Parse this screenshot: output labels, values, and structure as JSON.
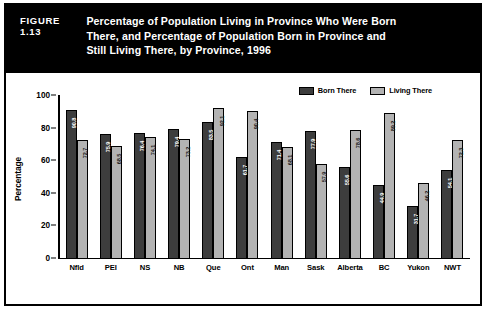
{
  "figure": {
    "number": "FIGURE 1.13",
    "title_lines": [
      "Percentage of Population Living in Province Who Were Born",
      "There, and Percentage of Population Born in Province and",
      "Still Living There, by Province, 1996"
    ]
  },
  "colors": {
    "banner_background": "#000000",
    "banner_text": "#ffffff",
    "born_there": "#3d3d3d",
    "living_there": "#b3b3b3",
    "page_background": "#ffffff",
    "frame_border": "#000000"
  },
  "chart_data": {
    "type": "bar",
    "title": "Percentage of Population Living in Province Who Were Born There, and Percentage of Population Born in Province and Still Living There, by Province, 1996",
    "xlabel": "",
    "ylabel": "Percentage",
    "ylim": [
      0,
      100
    ],
    "yticks": [
      0,
      20,
      40,
      60,
      80,
      100
    ],
    "grid": false,
    "legend_position": "top-right",
    "categories": [
      "Nfld",
      "PEI",
      "NS",
      "NB",
      "Que",
      "Ont",
      "Man",
      "Sask",
      "Alberta",
      "BC",
      "Yukon",
      "NWT"
    ],
    "series": [
      {
        "name": "Born There",
        "color": "#3d3d3d",
        "values": [
          90.8,
          75.9,
          76.4,
          79.4,
          83.5,
          61.7,
          71.4,
          77.9,
          55.6,
          44.9,
          31.7,
          54.1
        ]
      },
      {
        "name": "Living There",
        "color": "#b3b3b3",
        "values": [
          72.7,
          68.5,
          74.1,
          73.2,
          92.1,
          90.4,
          68.1,
          57.9,
          78.6,
          89.2,
          46.2,
          72.3
        ]
      }
    ]
  }
}
